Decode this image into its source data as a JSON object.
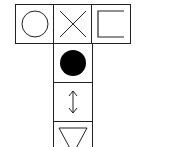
{
  "diagram": {
    "top_row": [
      {
        "symbol": "circle-outline-icon"
      },
      {
        "symbol": "cross-x-icon"
      },
      {
        "symbol": "bracket-square-icon"
      }
    ],
    "column": [
      {
        "symbol": "filled-circle-icon"
      },
      {
        "symbol": "up-down-arrow-icon"
      },
      {
        "symbol": "inverted-triangle-icon"
      }
    ],
    "stroke_color": "#222222",
    "fill_color": "#000000"
  }
}
